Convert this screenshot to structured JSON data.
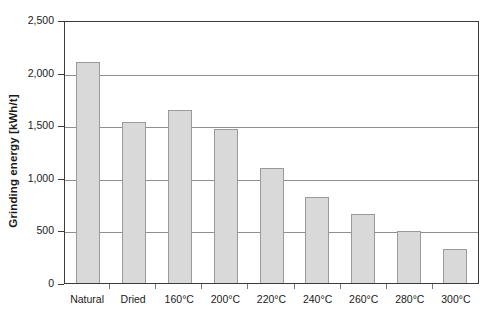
{
  "chart_data": {
    "type": "bar",
    "title": "",
    "xlabel": "",
    "ylabel": "Grinding energy [kWh/t]",
    "categories": [
      "Natural",
      "Dried",
      "160°C",
      "200°C",
      "220°C",
      "240°C",
      "260°C",
      "280°C",
      "300°C"
    ],
    "values": [
      2100,
      1530,
      1640,
      1465,
      1090,
      815,
      655,
      495,
      325
    ],
    "ylim": [
      0,
      2500
    ],
    "ytick_values": [
      0,
      500,
      1000,
      1500,
      2000,
      2500
    ],
    "ytick_labels": [
      "0",
      "500",
      "1,000",
      "1,500",
      "2,000",
      "2,500"
    ],
    "grid": true,
    "legend": false,
    "legend_position": "none",
    "bar_fill_color": "#d9d9d9",
    "bar_border_color": "#9a9a9a",
    "gridline_color": "#8f8f8f",
    "axis_color": "#3b3b3b",
    "background_color": "#ffffff"
  }
}
